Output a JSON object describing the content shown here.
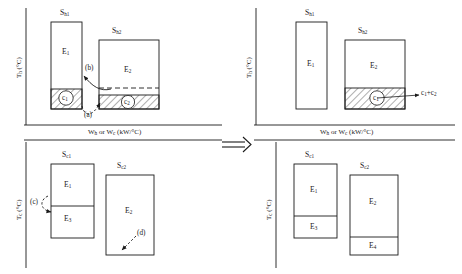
{
  "figure": {
    "type": "energy-block-transformation-diagram",
    "transform_arrow": "⟹"
  },
  "axes": {
    "hot": {
      "y_label_main": "T",
      "y_label_sub": "h",
      "y_label_unit": " (°C)",
      "x_label": "W",
      "x_label_sub1": "h",
      "x_label_mid": " or W",
      "x_label_sub2": "c",
      "x_label_unit": " (kW/°C)"
    },
    "cold": {
      "y_label_main": "T",
      "y_label_sub": "c",
      "y_label_unit": " (°C)"
    }
  },
  "panels": {
    "top_left": {
      "name": "hot-before",
      "blocks": [
        {
          "id": "sh1",
          "stream_label": "S",
          "stream_sub": "h1",
          "energy_label": "E",
          "energy_sub": "1",
          "hatched_label": "c",
          "hatched_sub": "1"
        },
        {
          "id": "sh2",
          "stream_label": "S",
          "stream_sub": "h2",
          "energy_label": "E",
          "energy_sub": "2",
          "hatched_label": "c",
          "hatched_sub": "2"
        }
      ],
      "annotations": [
        {
          "id": "a",
          "text": "(a)"
        },
        {
          "id": "b",
          "text": "(b)"
        }
      ]
    },
    "top_right": {
      "name": "hot-after",
      "blocks": [
        {
          "id": "sh1",
          "stream_label": "S",
          "stream_sub": "h1",
          "energy_label": "E",
          "energy_sub": "1"
        },
        {
          "id": "sh2",
          "stream_label": "S",
          "stream_sub": "h2",
          "energy_label": "E",
          "energy_sub": "2",
          "hatched_label": "c",
          "hatched_sub": "1"
        }
      ],
      "callout": {
        "text_a": "c",
        "sub_a": "1",
        "plus": "+c",
        "sub_b": "2"
      }
    },
    "bottom_left": {
      "name": "cold-before",
      "blocks": [
        {
          "id": "sc1",
          "stream_label": "S",
          "stream_sub": "c1",
          "energy_top": "E",
          "energy_top_sub": "1",
          "energy_bot": "E",
          "energy_bot_sub": "3"
        },
        {
          "id": "sc2",
          "stream_label": "S",
          "stream_sub": "c2",
          "energy_label": "E",
          "energy_sub": "2"
        }
      ],
      "annotations": [
        {
          "id": "c",
          "text": "(c)"
        },
        {
          "id": "d",
          "text": "(d)"
        }
      ]
    },
    "bottom_right": {
      "name": "cold-after",
      "blocks": [
        {
          "id": "sc1",
          "stream_label": "S",
          "stream_sub": "c1",
          "energy_top": "E",
          "energy_top_sub": "1",
          "energy_bot": "E",
          "energy_bot_sub": "3"
        },
        {
          "id": "sc2",
          "stream_label": "S",
          "stream_sub": "c2",
          "energy_top": "E",
          "energy_top_sub": "2",
          "energy_bot": "E",
          "energy_bot_sub": "4"
        }
      ]
    }
  }
}
